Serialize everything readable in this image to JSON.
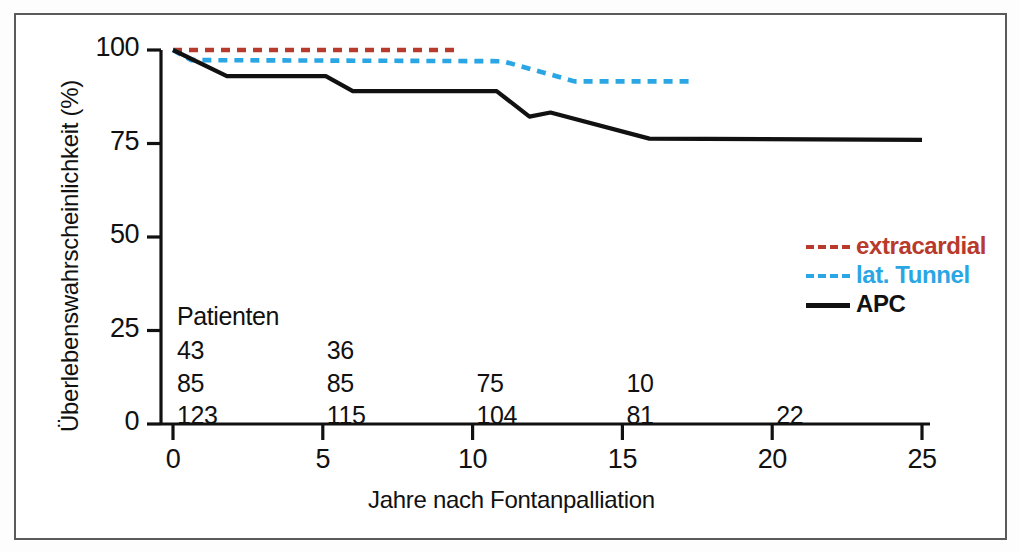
{
  "figure": {
    "frame": {
      "x": 14,
      "y": 13,
      "w": 993,
      "h": 527
    }
  },
  "chart_data": {
    "type": "line",
    "title": "",
    "xlabel": "Jahre nach Fontanpalliation",
    "ylabel": "Überlebenswahrscheinlichkeit (%)",
    "xlim": [
      0,
      25
    ],
    "ylim": [
      0,
      100
    ],
    "xticks": [
      0,
      5,
      10,
      15,
      20,
      25
    ],
    "xtick_labels": [
      "0",
      "5",
      "10",
      "15",
      "20",
      "25"
    ],
    "yticks": [
      0,
      25,
      50,
      75,
      100
    ],
    "ytick_labels": [
      "0",
      "25",
      "50",
      "75",
      "100"
    ],
    "grid": false,
    "legend_position": "right-middle",
    "series": [
      {
        "name": "extracardial",
        "color": "#b83a2c",
        "style": "dashed",
        "x": [
          0,
          9.6
        ],
        "y": [
          100,
          100
        ]
      },
      {
        "name": "lat. Tunnel",
        "color": "#2ba6e4",
        "style": "dashed",
        "x": [
          0,
          0.6,
          11.0,
          12.8,
          13.4,
          17.3
        ],
        "y": [
          100,
          97.3,
          97.0,
          93.0,
          91.6,
          91.6
        ]
      },
      {
        "name": "APC",
        "color": "#111111",
        "style": "solid",
        "x": [
          0,
          1.8,
          5.1,
          6.0,
          10.8,
          11.9,
          12.6,
          15.9,
          25.0
        ],
        "y": [
          100,
          93.0,
          93.0,
          89.0,
          89.0,
          82.2,
          83.3,
          76.3,
          76.0
        ]
      }
    ]
  },
  "risk_table": {
    "title": "Patienten",
    "columns": [
      0,
      5,
      10,
      15,
      20
    ],
    "rows": [
      {
        "series": "extracardial",
        "values": [
          "43",
          "36"
        ]
      },
      {
        "series": "lat. Tunnel",
        "values": [
          "85",
          "85",
          "75",
          "10"
        ]
      },
      {
        "series": "APC",
        "values": [
          "123",
          "115",
          "104",
          "81",
          "22"
        ]
      }
    ]
  },
  "legend": {
    "items": [
      {
        "label": "extracardial",
        "color": "#b83a2c",
        "style": "dashed"
      },
      {
        "label": "lat. Tunnel",
        "color": "#2ba6e4",
        "style": "dashed"
      },
      {
        "label": "APC",
        "color": "#111111",
        "style": "solid"
      }
    ]
  }
}
